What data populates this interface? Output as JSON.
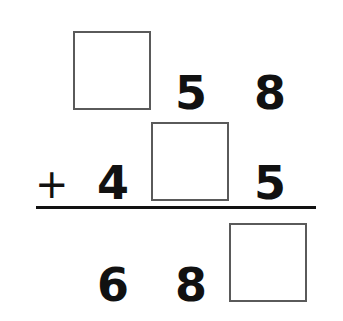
{
  "problem": {
    "type": "vertical-addition",
    "operator": "+",
    "rows": {
      "addend1": {
        "hundreds": "",
        "tens": "5",
        "ones": "8"
      },
      "addend2": {
        "hundreds": "4",
        "tens": "",
        "ones": "5"
      },
      "sum": {
        "hundreds": "6",
        "tens": "8",
        "ones": ""
      }
    },
    "blanks": [
      "addend1.hundreds",
      "addend2.tens",
      "sum.ones"
    ]
  },
  "colors": {
    "ink": "#111111",
    "box_border": "#5a5a5a",
    "background": "#ffffff"
  }
}
